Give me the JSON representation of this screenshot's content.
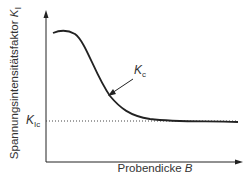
{
  "diagram": {
    "y_axis_label": "Spannungsintensitätsfaktor",
    "y_axis_symbol": "K",
    "y_axis_symbol_sub": "I",
    "x_axis_label": "Probendicke",
    "x_axis_symbol": "B",
    "threshold_label": "K",
    "threshold_label_sub": "Ic",
    "curve_label": "K",
    "curve_label_sub": "c",
    "colors": {
      "line": "#222222",
      "text": "#333333"
    }
  }
}
